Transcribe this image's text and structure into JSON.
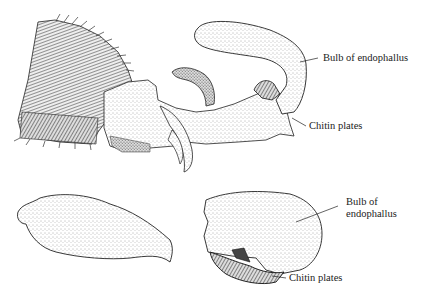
{
  "figure": {
    "panels": [
      {
        "id": "top",
        "description": "Lateral view of abdominal apex with everted endophallus",
        "labels": [
          {
            "text": "Bulb of endophallus"
          },
          {
            "text": "Chitin plates"
          }
        ]
      },
      {
        "id": "bottom-left",
        "description": "Isolated endophallus shape",
        "labels": []
      },
      {
        "id": "bottom-right",
        "description": "Bulb of endophallus, detailed view",
        "labels": [
          {
            "text_line1": "Bulb of",
            "text_line2": "endophallus"
          },
          {
            "text": "Chitin plates"
          }
        ]
      }
    ],
    "colors": {
      "ink": "#1a1a1a",
      "stipple": "#555555",
      "background": "#ffffff"
    }
  }
}
